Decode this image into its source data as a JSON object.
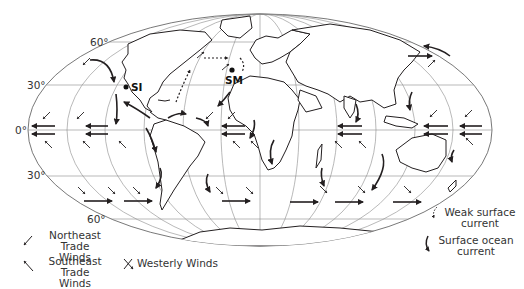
{
  "figure": {
    "latitude_labels": [
      "60°",
      "30°",
      "0°",
      "30°",
      "60°"
    ],
    "sites": [
      {
        "id": "SI",
        "label": "SI"
      },
      {
        "id": "SM",
        "label": "SM"
      }
    ],
    "legend": {
      "northeast_trade": {
        "line1": "Northeast Trade",
        "line2": "Winds",
        "icon": "arrow-southwest-icon"
      },
      "southeast_trade": {
        "line1": "Southeast Trade",
        "line2": "Winds",
        "icon": "arrow-northwest-icon"
      },
      "westerly": {
        "label": "Westerly Winds",
        "icon": "crossed-arrows-icon"
      },
      "weak_current": {
        "line1": "Weak surface",
        "line2": "current",
        "icon": "dotted-curved-arrow-icon"
      },
      "surface_current": {
        "line1": "Surface ocean",
        "line2": "current",
        "icon": "curved-arrow-icon"
      }
    },
    "colors": {
      "line": "#231f20",
      "grid": "#8a8a8a",
      "background": "#ffffff"
    }
  }
}
